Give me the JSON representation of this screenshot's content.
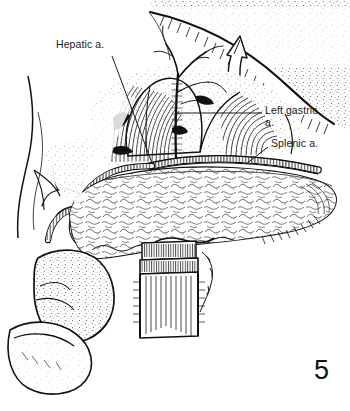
{
  "figure": {
    "number": "5",
    "domain": "medical-surgical-illustration",
    "caption_absent": true,
    "background_color": "#ffffff",
    "ink_color": "#111111",
    "style": "pen-and-ink line drawing with stipple and hatch shading"
  },
  "labels": [
    {
      "id": "hepatic",
      "text": "Hepatic a.",
      "anatomy": "hepatic artery",
      "x": 56,
      "y": 38,
      "leader_from": [
        112,
        56
      ],
      "leader_to": [
        152,
        162
      ]
    },
    {
      "id": "left-gastric",
      "text": "Left gastric\na.",
      "line1": "Left gastric",
      "line2": "a.",
      "anatomy": "left gastric artery",
      "x": 265,
      "y": 104,
      "leader_from": [
        262,
        113
      ],
      "leader_to": [
        174,
        113
      ]
    },
    {
      "id": "splenic",
      "text": "Splenic a.",
      "anatomy": "splenic artery",
      "x": 271,
      "y": 137,
      "leader_from": [
        268,
        147
      ],
      "leader_to": [
        246,
        165
      ]
    }
  ],
  "annotations": [
    {
      "id": "retraction-arrow",
      "kind": "curved-hollow-arrow",
      "meaning": "stomach retracted cephalad",
      "direction": "up"
    }
  ],
  "structures": [
    {
      "id": "stomach",
      "name": "stomach (retracted, posterior surface)",
      "shading": "stipple + edge hatch"
    },
    {
      "id": "pancreas",
      "name": "pancreas body and tail",
      "shading": "lobulated cobblestone outline"
    },
    {
      "id": "duodenum",
      "name": "duodenum / bowel loops",
      "shading": "stipple"
    },
    {
      "id": "celiac-axis",
      "name": "celiac axis / retroperitoneal bed",
      "shading": "dense line hatch"
    },
    {
      "id": "splenic-artery",
      "name": "splenic artery",
      "shading": "ladder-striped tube"
    },
    {
      "id": "hepatic-artery",
      "name": "hepatic artery",
      "shading": "ladder-striped tube"
    },
    {
      "id": "left-gastric-artery",
      "name": "left gastric artery",
      "shading": "thin branching line"
    },
    {
      "id": "portal-vein",
      "name": "portal vein / superior mesenteric vessels stump",
      "shading": "banded cylinder hatch"
    }
  ]
}
